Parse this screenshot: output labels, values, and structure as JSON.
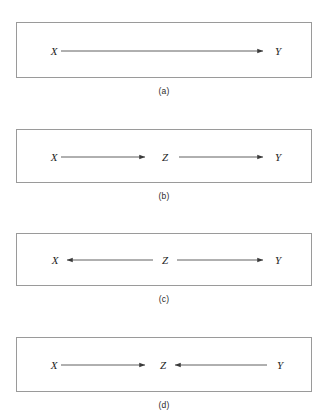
{
  "figure": {
    "background_color": "#ffffff",
    "box_border_color": "#9a9a9a",
    "edge_color": "#4f4f4f",
    "label_color": "#1d1d1d"
  },
  "panels": [
    {
      "caption": "(a)",
      "nodes": [
        {
          "id": "X",
          "label": "X"
        },
        {
          "id": "Y",
          "label": "Y"
        }
      ],
      "edges": [
        {
          "from": "X",
          "to": "Y",
          "direction": "right"
        }
      ]
    },
    {
      "caption": "(b)",
      "nodes": [
        {
          "id": "X",
          "label": "X"
        },
        {
          "id": "Z",
          "label": "Z"
        },
        {
          "id": "Y",
          "label": "Y"
        }
      ],
      "edges": [
        {
          "from": "X",
          "to": "Z",
          "direction": "right"
        },
        {
          "from": "Z",
          "to": "Y",
          "direction": "right"
        }
      ]
    },
    {
      "caption": "(c)",
      "nodes": [
        {
          "id": "X",
          "label": "X"
        },
        {
          "id": "Z",
          "label": "Z"
        },
        {
          "id": "Y",
          "label": "Y"
        }
      ],
      "edges": [
        {
          "from": "Z",
          "to": "X",
          "direction": "left"
        },
        {
          "from": "Z",
          "to": "Y",
          "direction": "right"
        }
      ]
    },
    {
      "caption": "(d)",
      "nodes": [
        {
          "id": "X",
          "label": "X"
        },
        {
          "id": "Z",
          "label": "Z"
        },
        {
          "id": "Y",
          "label": "Y"
        }
      ],
      "edges": [
        {
          "from": "X",
          "to": "Z",
          "direction": "right"
        },
        {
          "from": "Y",
          "to": "Z",
          "direction": "left"
        }
      ]
    }
  ]
}
